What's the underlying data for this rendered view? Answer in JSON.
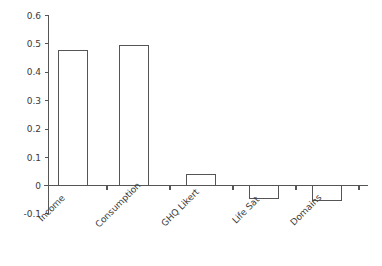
{
  "chart_data": {
    "type": "bar",
    "title": "",
    "subtitle": "",
    "xlabel": "",
    "ylabel": "",
    "categories": [
      "Income",
      "Consumption",
      "GHQ Likert",
      "Life Sat",
      "Domains"
    ],
    "values": [
      0.478,
      0.494,
      0.04,
      -0.045,
      -0.052
    ],
    "series": [
      {
        "name": "",
        "values": [
          0.478,
          0.494,
          0.04,
          -0.045,
          -0.052
        ]
      }
    ],
    "ylim": [
      -0.1,
      0.6
    ],
    "yticks": [
      -0.1,
      0,
      0.1,
      0.2,
      0.3,
      0.4,
      0.5,
      0.6
    ],
    "ytick_labels": [
      "-0.1",
      "0",
      "0.1",
      "0.2",
      "0.3",
      "0.4",
      "0.5",
      "0.6"
    ],
    "grid": false,
    "legend": false,
    "legend_position": "none",
    "bar_fill_color": "#ffffff",
    "bar_edge_color": "#555555",
    "axis_color": "#555555",
    "background_color": "#ffffff",
    "category_label_rotation_deg": -45,
    "baseline_value": 0
  }
}
